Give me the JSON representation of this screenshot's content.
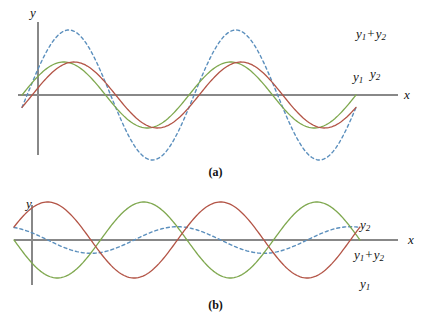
{
  "figure": {
    "background": "#ffffff",
    "axis_color": "#888888"
  },
  "colors": {
    "y1_green": "#7fa84f",
    "y2_red": "#b35446",
    "sum_blue": "#5b8fbd",
    "axis": "#888888"
  },
  "panels": [
    {
      "id": "a",
      "caption": "(a)",
      "y_axis_label": "y",
      "x_axis_label": "x",
      "labels": {
        "sum": {
          "base": "y",
          "sub1": "1",
          "op": "+",
          "base2": "y",
          "sub2": "2"
        },
        "y1": {
          "base": "y",
          "sub": "1"
        },
        "y2": {
          "base": "y",
          "sub": "2"
        }
      }
    },
    {
      "id": "b",
      "caption": "(b)",
      "y_axis_label": "y",
      "x_axis_label": "x",
      "labels": {
        "y2": {
          "base": "y",
          "sub": "2"
        },
        "sum": {
          "base": "y",
          "sub1": "1",
          "op": "+",
          "base2": "y",
          "sub2": "2"
        },
        "y1": {
          "base": "y",
          "sub": "1"
        }
      }
    }
  ],
  "chart_data": [
    {
      "type": "line",
      "title": "(a) Constructive interference of two nearly in-phase waves",
      "xlabel": "x",
      "ylabel": "y",
      "xlim": [
        0,
        2
      ],
      "ylim": [
        -2.1,
        2.1
      ],
      "grid": false,
      "legend_position": "right-inline",
      "series": [
        {
          "name": "y1",
          "label": "y₁",
          "color": "#7fa84f",
          "style": "solid",
          "amplitude": 1.0,
          "periods": 2,
          "phase_deg": 0,
          "note": "green sine starting at origin rising"
        },
        {
          "name": "y2",
          "label": "y₂",
          "color": "#b35446",
          "style": "solid",
          "amplitude": 1.0,
          "periods": 2,
          "phase_deg": -22,
          "note": "red sine slightly lagging y1"
        },
        {
          "name": "y1+y2",
          "label": "y₁ + y₂",
          "color": "#5b8fbd",
          "style": "dashed",
          "amplitude": 1.97,
          "periods": 2,
          "phase_deg": -11,
          "note": "dashed resultant, nearly double amplitude"
        }
      ]
    },
    {
      "type": "line",
      "title": "(b) Destructive interference of two nearly out-of-phase waves",
      "xlabel": "x",
      "ylabel": "y",
      "xlim": [
        0,
        2
      ],
      "ylim": [
        -1.15,
        1.15
      ],
      "grid": false,
      "legend_position": "right-inline",
      "series": [
        {
          "name": "y1",
          "label": "y₁",
          "color": "#7fa84f",
          "style": "solid",
          "amplitude": 1.0,
          "periods": 2,
          "phase_deg": 180,
          "note": "green sine starting at origin falling"
        },
        {
          "name": "y2",
          "label": "y₂",
          "color": "#b35446",
          "style": "solid",
          "amplitude": 1.0,
          "periods": 2,
          "phase_deg": 20,
          "note": "red sine nearly antiphase to y1"
        },
        {
          "name": "y1+y2",
          "label": "y₁ + y₂",
          "color": "#5b8fbd",
          "style": "dashed",
          "amplitude": 0.35,
          "periods": 2,
          "phase_deg": 110,
          "note": "dashed resultant, small amplitude"
        }
      ]
    }
  ]
}
